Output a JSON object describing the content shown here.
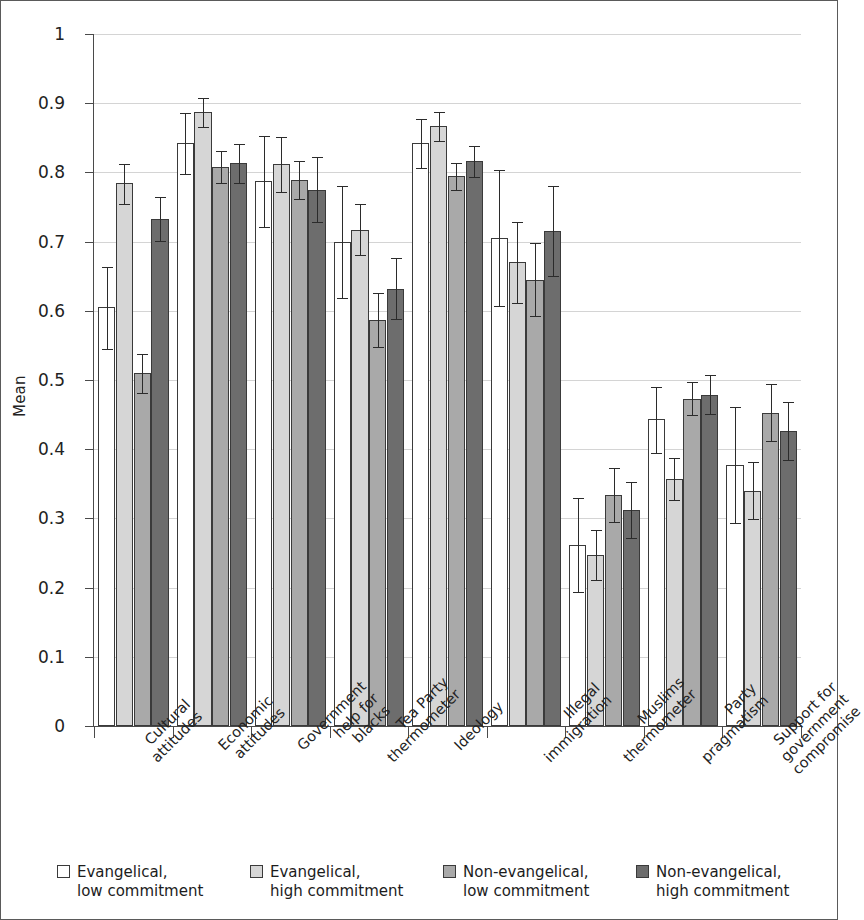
{
  "chart_data": {
    "type": "bar",
    "title": "",
    "xlabel": "",
    "ylabel": "Mean",
    "ylim": [
      0,
      1
    ],
    "ytick_labels": [
      "0",
      "0.1",
      "0.2",
      "0.3",
      "0.4",
      "0.5",
      "0.6",
      "0.7",
      "0.8",
      "0.9",
      "1"
    ],
    "ytick_values": [
      0,
      0.1,
      0.2,
      0.3,
      0.4,
      0.5,
      0.6,
      0.7,
      0.8,
      0.9,
      1
    ],
    "grid": true,
    "legend_position": "bottom",
    "error_bars": "95% confidence interval",
    "categories": [
      [
        "Cultural",
        "attitudes"
      ],
      [
        "Economic",
        "attitudes"
      ],
      [
        "Government",
        "help for",
        "blacks"
      ],
      [
        "Tea Party",
        "thermometer"
      ],
      [
        "Ideology"
      ],
      [
        "Illegal",
        "immigration"
      ],
      [
        "Muslims",
        "thermometer"
      ],
      [
        "Party",
        "pragmatism"
      ],
      [
        "Support for",
        "government",
        "compromise"
      ]
    ],
    "series": [
      {
        "name": "Evangelical, low commitment",
        "color": "#ffffff",
        "values": [
          0.605,
          0.843,
          0.788,
          0.7,
          0.843,
          0.705,
          0.262,
          0.443,
          0.377
        ],
        "err_low": [
          0.545,
          0.797,
          0.721,
          0.618,
          0.806,
          0.607,
          0.194,
          0.395,
          0.293
        ],
        "err_high": [
          0.663,
          0.886,
          0.853,
          0.781,
          0.877,
          0.803,
          0.33,
          0.49,
          0.461
        ]
      },
      {
        "name": "Evangelical, high commitment",
        "color": "#d6d6d6",
        "values": [
          0.785,
          0.888,
          0.812,
          0.717,
          0.867,
          0.67,
          0.247,
          0.357,
          0.34
        ],
        "err_low": [
          0.755,
          0.866,
          0.772,
          0.68,
          0.846,
          0.611,
          0.211,
          0.327,
          0.299
        ],
        "err_high": [
          0.812,
          0.908,
          0.851,
          0.754,
          0.888,
          0.729,
          0.283,
          0.388,
          0.381
        ]
      },
      {
        "name": "Non-evangelical, low commitment",
        "color": "#a9a9a9",
        "values": [
          0.51,
          0.808,
          0.789,
          0.587,
          0.795,
          0.645,
          0.334,
          0.473,
          0.453
        ],
        "err_low": [
          0.481,
          0.784,
          0.761,
          0.548,
          0.775,
          0.592,
          0.295,
          0.449,
          0.412
        ],
        "err_high": [
          0.538,
          0.831,
          0.817,
          0.626,
          0.814,
          0.698,
          0.373,
          0.497,
          0.494
        ]
      },
      {
        "name": "Non-evangelical, high commitment",
        "color": "#6d6d6d",
        "values": [
          0.733,
          0.813,
          0.775,
          0.632,
          0.816,
          0.716,
          0.312,
          0.479,
          0.426
        ],
        "err_low": [
          0.701,
          0.784,
          0.729,
          0.588,
          0.793,
          0.65,
          0.272,
          0.451,
          0.384
        ],
        "err_high": [
          0.765,
          0.841,
          0.822,
          0.676,
          0.838,
          0.781,
          0.352,
          0.507,
          0.468
        ]
      }
    ]
  },
  "legend": {
    "items": [
      {
        "line1": "Evangelical,",
        "line2": "low commitment",
        "color": "#ffffff"
      },
      {
        "line1": "Evangelical,",
        "line2": "high commitment",
        "color": "#d6d6d6"
      },
      {
        "line1": "Non-evangelical,",
        "line2": "low commitment",
        "color": "#a9a9a9"
      },
      {
        "line1": "Non-evangelical,",
        "line2": "high commitment",
        "color": "#6d6d6d"
      }
    ]
  }
}
